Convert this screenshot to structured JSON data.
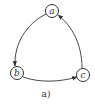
{
  "diagram": {
    "type": "directed-graph",
    "caption": "a)",
    "nodes": [
      {
        "id": "a",
        "label": "a"
      },
      {
        "id": "b",
        "label": "b"
      },
      {
        "id": "c",
        "label": "c"
      }
    ],
    "edges": [
      {
        "from": "a",
        "to": "b"
      },
      {
        "from": "b",
        "to": "c"
      },
      {
        "from": "c",
        "to": "a"
      }
    ],
    "colors": {
      "stroke": "#333333",
      "background": "#ffffff"
    }
  }
}
